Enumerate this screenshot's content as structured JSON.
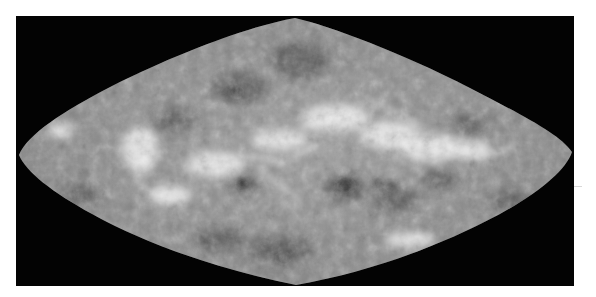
{
  "figure": {
    "projection": "sinusoidal",
    "rendering": "grayscale",
    "colors": {
      "page_background": "#ffffff",
      "frame_background": "#030303",
      "surface_base": "#8a8a8a",
      "highlands": "#f2f2f2",
      "lowlands": "#3a3a3a"
    },
    "bounds": {
      "frame": {
        "x": 16,
        "y": 16,
        "width": 558,
        "height": 270
      },
      "map_left_x": 19,
      "map_right_x": 572,
      "top_apex": {
        "x": 295,
        "y": 18
      },
      "bottom_apex": {
        "x": 296,
        "y": 285
      },
      "equator_y": 155
    }
  }
}
